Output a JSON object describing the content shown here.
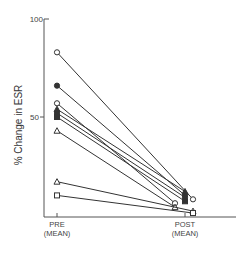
{
  "chart_data": {
    "type": "line",
    "title": "",
    "xlabel": "",
    "ylabel": "% Change in ESR",
    "ylim": [
      0,
      100
    ],
    "yticks": [
      50,
      100
    ],
    "ytick_labels": [
      "50",
      "100"
    ],
    "categories": [
      "PRE\n(MEAN)",
      "POST\n(MEAN)"
    ],
    "category_labels": [
      {
        "line1": "PRE",
        "line2": "(MEAN)"
      },
      {
        "line1": "POST",
        "line2": "(MEAN)"
      }
    ],
    "grid": false,
    "legend": null,
    "series": [
      {
        "name": "subject-1",
        "marker": "open-circle",
        "values": [
          83,
          8
        ]
      },
      {
        "name": "subject-2",
        "marker": "filled-circle",
        "values": [
          66,
          10
        ]
      },
      {
        "name": "subject-3",
        "marker": "open-circle",
        "values": [
          57,
          6
        ]
      },
      {
        "name": "subject-4",
        "marker": "filled-triangle",
        "values": [
          54,
          12
        ]
      },
      {
        "name": "subject-5",
        "marker": "filled-circle",
        "values": [
          52,
          9
        ]
      },
      {
        "name": "subject-6",
        "marker": "filled-square",
        "values": [
          50,
          7
        ]
      },
      {
        "name": "subject-7",
        "marker": "open-triangle",
        "values": [
          43,
          4
        ]
      },
      {
        "name": "subject-8",
        "marker": "open-triangle",
        "values": [
          17,
          2
        ]
      },
      {
        "name": "subject-9",
        "marker": "open-square",
        "values": [
          10,
          1
        ]
      }
    ],
    "post_x_offsets": [
      8,
      0,
      -10,
      0,
      0,
      0,
      -10,
      8,
      8
    ]
  },
  "labels": {
    "y_title": "% Change in ESR",
    "y_tick_100": "100",
    "y_tick_50": "50",
    "pre_line1": "PRE",
    "pre_line2": "(MEAN)",
    "post_line1": "POST",
    "post_line2": "(MEAN)"
  }
}
